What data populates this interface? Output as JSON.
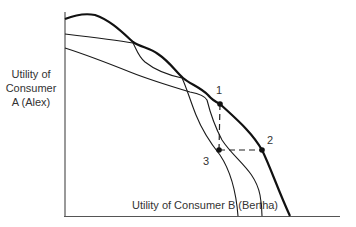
{
  "diagram": {
    "y_axis_label": [
      "Utility of",
      "Consumer",
      "A (Alex)"
    ],
    "x_axis_label": "Utility of Consumer B (Bertha)",
    "points": [
      {
        "label": "1",
        "x": 220,
        "y": 104
      },
      {
        "label": "2",
        "x": 262,
        "y": 150
      },
      {
        "label": "3",
        "x": 218,
        "y": 150
      }
    ],
    "curves": [
      {
        "name": "utility-possibility-frontier-envelope",
        "style": "thick"
      },
      {
        "name": "utility-possibility-curve-1",
        "style": "thin"
      },
      {
        "name": "utility-possibility-curve-2",
        "style": "thin"
      }
    ],
    "colors": {
      "line": "#1a1a1a",
      "axis": "#555555"
    }
  }
}
